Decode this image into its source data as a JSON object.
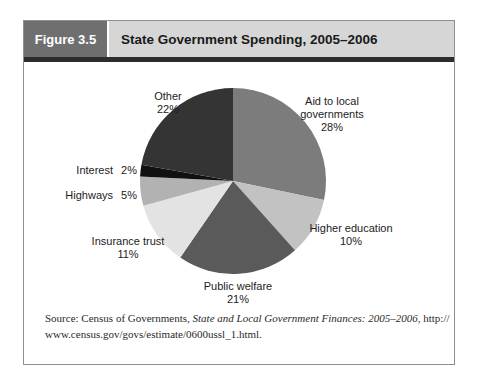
{
  "header": {
    "figure_label": "Figure 3.5",
    "title": "State Government Spending, 2005–2006"
  },
  "chart_data": {
    "type": "pie",
    "title": "State Government Spending, 2005–2006",
    "unit": "percent of state government spending",
    "direction": "clockwise",
    "start_angle_deg": 0,
    "legend": "labels placed around pie",
    "slices": [
      {
        "key": "aid-to-local-governments",
        "label": "Aid to local governments",
        "pct_label": "28%",
        "value": 28,
        "color": "#7c7c7c"
      },
      {
        "key": "higher-education",
        "label": "Higher education",
        "pct_label": "10%",
        "value": 10,
        "color": "#c2c2c2"
      },
      {
        "key": "public-welfare",
        "label": "Public welfare",
        "pct_label": "21%",
        "value": 21,
        "color": "#5a5a5a"
      },
      {
        "key": "insurance-trust",
        "label": "Insurance trust",
        "pct_label": "11%",
        "value": 11,
        "color": "#e3e3e3"
      },
      {
        "key": "highways",
        "label": "Highways",
        "pct_label": "5%",
        "value": 5,
        "color": "#b2b2b2"
      },
      {
        "key": "interest",
        "label": "Interest",
        "pct_label": "2%",
        "value": 2,
        "color": "#111111"
      },
      {
        "key": "other",
        "label": "Other",
        "pct_label": "22%",
        "value": 22,
        "color": "#343434"
      }
    ]
  },
  "source": {
    "prefix": "Source: Census of Governments, ",
    "italic": "State and Local Government Finances: 2005–2006",
    "separator": ", ",
    "url_first_line": "http://",
    "url_second_line": "www.census.gov/govs/estimate/0600ussl_1.html."
  },
  "colors": {
    "figure_border": "#8f8f8f",
    "figure_number_bg": "#6f6f6f",
    "figure_number_text": "#ffffff",
    "title_bar_bg": "#d6d6d6",
    "title_text": "#1a1a1a",
    "header_rule": "#2d2d2d",
    "body_bg": "#ffffff",
    "label_text": "#1c1c1c"
  }
}
